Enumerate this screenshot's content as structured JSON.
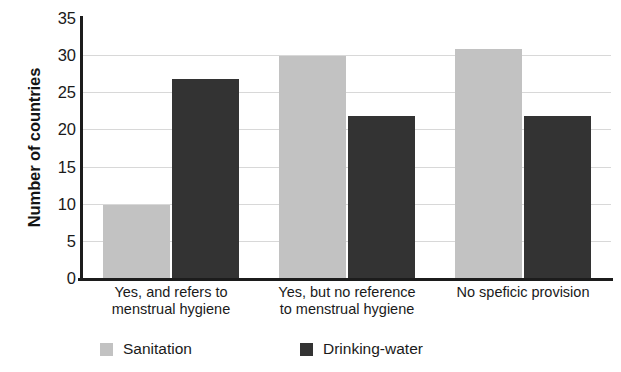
{
  "chart_data": {
    "type": "bar",
    "title": "",
    "xlabel": "",
    "ylabel": "Number of countries",
    "ylim": [
      0,
      35
    ],
    "ytick_step": 5,
    "yticks": [
      "35",
      "30",
      "25",
      "20",
      "15",
      "10",
      "5",
      "0"
    ],
    "grid": true,
    "grid_axis": "y",
    "legend_position": "bottom",
    "categories": [
      "Yes, and refers to\nmenstrual hygiene",
      "Yes, but no reference\nto menstrual hygiene",
      "No speficic provision"
    ],
    "category_lines": [
      [
        "Yes, and refers to",
        "menstrual hygiene"
      ],
      [
        "Yes, but no reference",
        "to menstrual hygiene"
      ],
      [
        "No speficic provision",
        ""
      ]
    ],
    "series": [
      {
        "name": "Sanitation",
        "color": "#c2c2c2",
        "values": [
          9.8,
          29.9,
          30.8
        ]
      },
      {
        "name": "Drinking-water",
        "color": "#333333",
        "values": [
          26.8,
          21.8,
          21.8
        ]
      }
    ]
  },
  "legend": {
    "items": [
      {
        "label": "Sanitation",
        "color": "#c2c2c2"
      },
      {
        "label": "Drinking-water",
        "color": "#333333"
      }
    ]
  },
  "colors": {
    "sanitation": "#c2c2c2",
    "drinking_water": "#333333",
    "axis": "#1c1c1c",
    "gridline": "#d8d8d8",
    "text": "#1a1a1a",
    "background": "#ffffff"
  }
}
